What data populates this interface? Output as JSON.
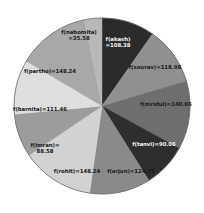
{
  "chart_data": {
    "type": "pie",
    "title": "",
    "subtitle": "",
    "xlabel": "",
    "ylabel": "",
    "legend": "none",
    "grid": false,
    "labels_inside": true,
    "start_angle_deg": 0,
    "direction": "clockwise",
    "total": 1115.36,
    "categories": [
      "f(akash)",
      "f(sourav)",
      "f(mridul)",
      "f(tanvi)",
      "f(arjun)",
      "f(rohit)",
      "f(imran)",
      "f(barnita)",
      "f(partho)",
      "f(nabomita)"
    ],
    "values": [
      108.38,
      118.98,
      140.06,
      90.06,
      124.72,
      148.24,
      88.58,
      111.46,
      148.24,
      35.58
    ],
    "slices": [
      {
        "name": "akash",
        "label": "f(akash)\n=108.38",
        "label_line1": "f(akash)",
        "label_line2": "=108.38",
        "value": 108.38,
        "color": "#2b2b2b",
        "text_color": "light",
        "label_x": 118,
        "label_y": 42
      },
      {
        "name": "sourav",
        "label": "f(sourav)=118.98",
        "label_line1": "f(sourav)=118.98",
        "label_line2": "",
        "value": 118.98,
        "color": "#909090",
        "text_color": "dark",
        "label_x": 155,
        "label_y": 67
      },
      {
        "name": "mridul",
        "label": "f(mridul)=140.06",
        "label_line1": "f(mridul)=140.06",
        "label_line2": "",
        "value": 140.06,
        "color": "#6e6e6e",
        "text_color": "dark",
        "label_x": 166,
        "label_y": 104
      },
      {
        "name": "tanvi",
        "label": "f(tanvi)=90.06",
        "label_line1": "f(tanvi)=90.06",
        "label_line2": "",
        "value": 90.06,
        "color": "#2e2e2e",
        "text_color": "light",
        "label_x": 154,
        "label_y": 144
      },
      {
        "name": "arjun",
        "label": "f(arjun)=124.72",
        "label_line1": "f(arjun)=124.72",
        "label_line2": "",
        "value": 124.72,
        "color": "#8a8a8a",
        "text_color": "dark",
        "label_x": 131,
        "label_y": 171
      },
      {
        "name": "rohit",
        "label": "f(rohit)=148.24",
        "label_line1": "f(rohit)=148.24",
        "label_line2": "",
        "value": 148.24,
        "color": "#d2d2d2",
        "text_color": "dark",
        "label_x": 77,
        "label_y": 171
      },
      {
        "name": "imran",
        "label": "f(imran)=\n88.58",
        "label_line1": "f(imran)=",
        "label_line2": "88.58",
        "value": 88.58,
        "color": "#9c9c9c",
        "text_color": "dark",
        "label_x": 45,
        "label_y": 148
      },
      {
        "name": "barnita",
        "label": "f(barnita)=111.46",
        "label_line1": "f(barnita)=111.46",
        "label_line2": "",
        "value": 111.46,
        "color": "#dedede",
        "text_color": "dark",
        "label_x": 40,
        "label_y": 109
      },
      {
        "name": "partho",
        "label": "f(partho)=148.24",
        "label_line1": "f(partho)=148.24",
        "label_line2": "",
        "value": 148.24,
        "color": "#a8a8a8",
        "text_color": "dark",
        "label_x": 50,
        "label_y": 71
      },
      {
        "name": "nabomita",
        "label": "f(nabomita)\n=35.58",
        "label_line1": "f(nabomita)",
        "label_line2": "=35.58",
        "value": 35.58,
        "color": "#b8b8b8",
        "text_color": "dark",
        "label_x": 79,
        "label_y": 35
      }
    ],
    "geometry": {
      "center_x": 102,
      "center_y": 106,
      "radius": 88
    },
    "colors": {
      "background": "#ffffff",
      "outline": "#6a6a6a"
    }
  }
}
